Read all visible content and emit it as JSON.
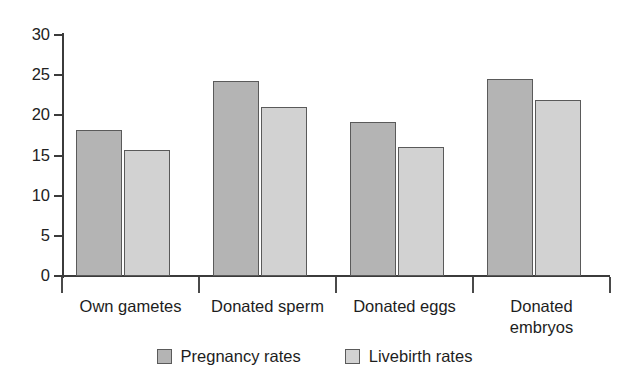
{
  "chart_data": {
    "type": "bar",
    "title": "",
    "subtitle": "",
    "xlabel": "",
    "ylabel": "",
    "ylim": [
      0,
      30
    ],
    "yticks": [
      0,
      5,
      10,
      15,
      20,
      25,
      30
    ],
    "ytick_labels": [
      "0",
      "5",
      "10",
      "15",
      "20",
      "25",
      "30"
    ],
    "grid": false,
    "legend_position": "bottom-center",
    "categories": [
      "Own gametes",
      "Donated sperm",
      "Donated eggs",
      "Donated embryos"
    ],
    "category_labels_wrapped": [
      "Own gametes",
      "Donated sperm",
      "Donated eggs",
      "Donated\nembryos"
    ],
    "series": [
      {
        "name": "Pregnancy rates",
        "color": "#b4b4b4",
        "values": [
          18.2,
          24.3,
          19.2,
          24.5
        ]
      },
      {
        "name": "Livebirth rates",
        "color": "#d2d2d2",
        "values": [
          15.7,
          21.0,
          16.0,
          21.9
        ]
      }
    ],
    "annotations": []
  },
  "colors": {
    "background": "#ffffff",
    "axis": "#3b3b3b",
    "text": "#1d1d1d",
    "series_pregnancy": "#b4b4b4",
    "series_livebirth": "#d2d2d2",
    "bar_outline": "#5a5a5a"
  }
}
